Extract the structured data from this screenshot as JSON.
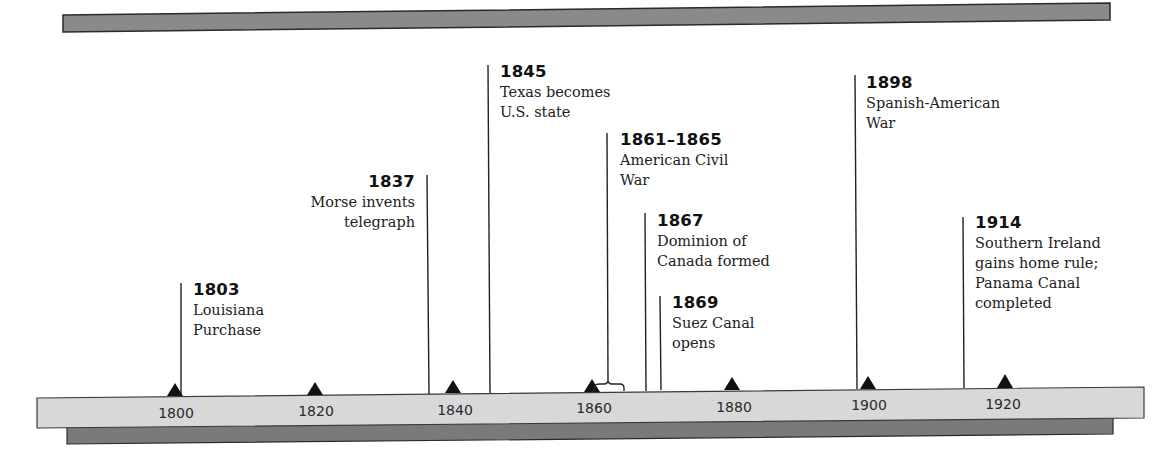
{
  "timeline": {
    "axis": {
      "ticks": [
        {
          "label": "1800",
          "year": 1800
        },
        {
          "label": "1820",
          "year": 1820
        },
        {
          "label": "1840",
          "year": 1840
        },
        {
          "label": "1860",
          "year": 1860
        },
        {
          "label": "1880",
          "year": 1880
        },
        {
          "label": "1900",
          "year": 1900
        },
        {
          "label": "1920",
          "year": 1920
        }
      ]
    },
    "events": [
      {
        "year_label": "1803",
        "line1": "Louisiana",
        "line2": "Purchase"
      },
      {
        "year_label": "1837",
        "line1": "Morse invents",
        "line2": "telegraph"
      },
      {
        "year_label": "1845",
        "line1": "Texas becomes",
        "line2": "U.S. state"
      },
      {
        "year_label": "1861–1865",
        "line1": "American Civil",
        "line2": "War"
      },
      {
        "year_label": "1867",
        "line1": "Dominion of",
        "line2": "Canada formed"
      },
      {
        "year_label": "1869",
        "line1": "Suez Canal",
        "line2": "opens"
      },
      {
        "year_label": "1898",
        "line1": "Spanish-American",
        "line2": "War"
      },
      {
        "year_label": "1914",
        "line1": "Southern Ireland",
        "line2": "gains home rule;",
        "line3": "Panama Canal",
        "line4": "completed"
      }
    ],
    "colors": {
      "bar_light": "#d6d6d6",
      "bar_dark": "#7a7a7a",
      "top_bar": "#8a8a8a",
      "ink": "#111111"
    }
  }
}
